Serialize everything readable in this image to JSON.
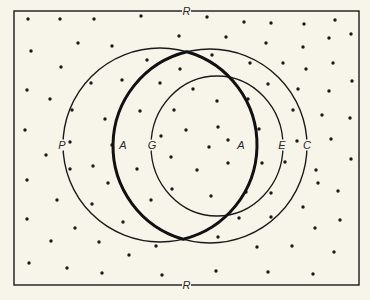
{
  "figure": {
    "background": "#f7f5ea",
    "ink": "#1a1a1a",
    "frame": {
      "x": 14,
      "y": 11,
      "width": 345,
      "height": 274,
      "top_label": "R",
      "bottom_label": "R"
    },
    "circles": [
      {
        "id": "P",
        "label": "P",
        "cx": 160,
        "cy": 145,
        "r": 97,
        "stroke_width": 1.4,
        "label_x": 62,
        "label_y": 145
      },
      {
        "id": "C",
        "label": "C",
        "cx": 210,
        "cy": 146,
        "r": 97,
        "stroke_width": 1.4,
        "label_x": 307,
        "label_y": 145
      },
      {
        "id": "E",
        "label": "E",
        "cx": 217,
        "cy": 146,
        "rx": 66,
        "ry": 70,
        "stroke_width": 1.3,
        "label_x": 282,
        "label_y": 145
      },
      {
        "id": "G",
        "label": "G",
        "label_x": 152,
        "label_y": 145
      }
    ],
    "lens": {
      "id": "A",
      "label_left": "A",
      "label_right": "A",
      "stroke_width": 3,
      "left_label_x": 123,
      "right_label_x": 241,
      "label_y": 145
    },
    "dots": [
      [
        28,
        19
      ],
      [
        60,
        19
      ],
      [
        94,
        19
      ],
      [
        141,
        16
      ],
      [
        207,
        17
      ],
      [
        244,
        22
      ],
      [
        271,
        23
      ],
      [
        304,
        24
      ],
      [
        335,
        20
      ],
      [
        31,
        51
      ],
      [
        78,
        43
      ],
      [
        112,
        46
      ],
      [
        179,
        36
      ],
      [
        226,
        37
      ],
      [
        266,
        43
      ],
      [
        303,
        47
      ],
      [
        329,
        38
      ],
      [
        351,
        34
      ],
      [
        61,
        67
      ],
      [
        147,
        60
      ],
      [
        212,
        55
      ],
      [
        250,
        63
      ],
      [
        283,
        63
      ],
      [
        306,
        69
      ],
      [
        333,
        63
      ],
      [
        27,
        90
      ],
      [
        50,
        99
      ],
      [
        91,
        83
      ],
      [
        122,
        80
      ],
      [
        160,
        83
      ],
      [
        180,
        69
      ],
      [
        193,
        89
      ],
      [
        268,
        84
      ],
      [
        298,
        89
      ],
      [
        329,
        91
      ],
      [
        352,
        81
      ],
      [
        72,
        110
      ],
      [
        105,
        119
      ],
      [
        140,
        111
      ],
      [
        174,
        110
      ],
      [
        217,
        101
      ],
      [
        248,
        99
      ],
      [
        293,
        110
      ],
      [
        322,
        115
      ],
      [
        350,
        118
      ],
      [
        25,
        130
      ],
      [
        70,
        142
      ],
      [
        112,
        145
      ],
      [
        161,
        136
      ],
      [
        186,
        130
      ],
      [
        218,
        127
      ],
      [
        259,
        129
      ],
      [
        331,
        139
      ],
      [
        209,
        147
      ],
      [
        228,
        140
      ],
      [
        297,
        141
      ],
      [
        46,
        155
      ],
      [
        93,
        166
      ],
      [
        137,
        169
      ],
      [
        171,
        157
      ],
      [
        197,
        170
      ],
      [
        228,
        163
      ],
      [
        262,
        163
      ],
      [
        285,
        162
      ],
      [
        316,
        170
      ],
      [
        351,
        159
      ],
      [
        27,
        180
      ],
      [
        70,
        169
      ],
      [
        108,
        183
      ],
      [
        172,
        189
      ],
      [
        318,
        183
      ],
      [
        57,
        200
      ],
      [
        92,
        204
      ],
      [
        151,
        200
      ],
      [
        211,
        196
      ],
      [
        246,
        192
      ],
      [
        271,
        193
      ],
      [
        338,
        191
      ],
      [
        27,
        219
      ],
      [
        75,
        228
      ],
      [
        123,
        222
      ],
      [
        239,
        218
      ],
      [
        271,
        217
      ],
      [
        303,
        207
      ],
      [
        315,
        228
      ],
      [
        340,
        220
      ],
      [
        51,
        241
      ],
      [
        99,
        242
      ],
      [
        156,
        246
      ],
      [
        218,
        237
      ],
      [
        257,
        247
      ],
      [
        292,
        246
      ],
      [
        334,
        252
      ],
      [
        29,
        263
      ],
      [
        67,
        268
      ],
      [
        102,
        273
      ],
      [
        129,
        255
      ],
      [
        162,
        275
      ],
      [
        216,
        271
      ],
      [
        268,
        272
      ],
      [
        313,
        274
      ]
    ]
  }
}
